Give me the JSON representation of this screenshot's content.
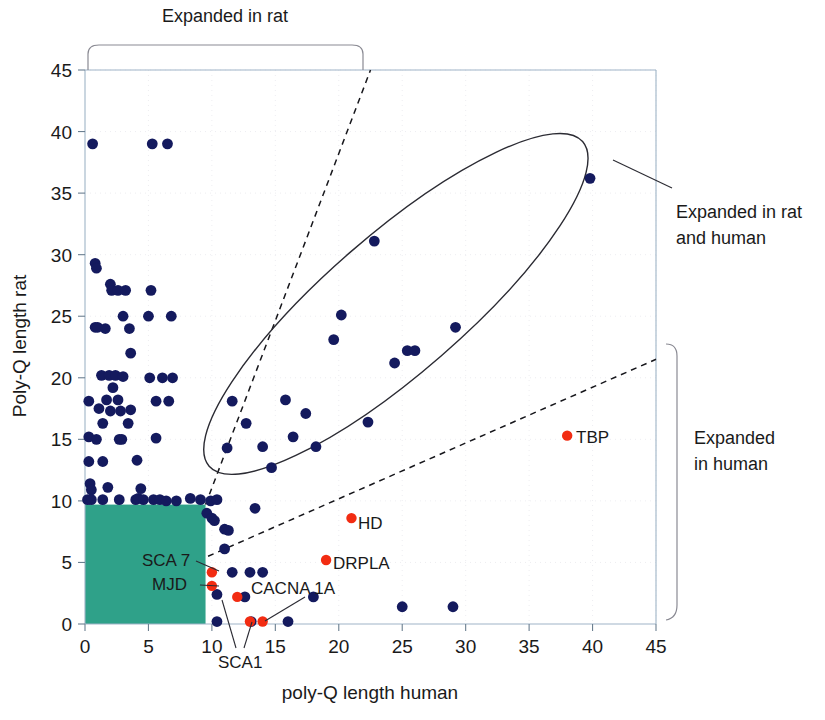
{
  "chart_data": {
    "type": "scatter",
    "title": "",
    "xlabel": "poly-Q length human",
    "ylabel": "Poly-Q length rat",
    "xlim": [
      0,
      45
    ],
    "ylim": [
      0,
      45
    ],
    "xticks": [
      0,
      5,
      10,
      15,
      20,
      25,
      30,
      35,
      40,
      45
    ],
    "yticks": [
      0,
      5,
      10,
      15,
      20,
      25,
      30,
      35,
      40,
      45
    ],
    "grid": true,
    "legend": "none",
    "series": [
      {
        "name": "genes",
        "color": "#141a5e",
        "points": [
          [
            0.6,
            39.0
          ],
          [
            5.3,
            39.0
          ],
          [
            6.5,
            39.0
          ],
          [
            0.8,
            29.3
          ],
          [
            0.9,
            28.9
          ],
          [
            2.0,
            27.6
          ],
          [
            2.1,
            27.1
          ],
          [
            2.6,
            27.1
          ],
          [
            3.2,
            27.1
          ],
          [
            5.2,
            27.1
          ],
          [
            0.8,
            24.1
          ],
          [
            1.0,
            24.1
          ],
          [
            1.6,
            24.0
          ],
          [
            3.0,
            25.0
          ],
          [
            5.0,
            25.0
          ],
          [
            6.8,
            25.0
          ],
          [
            3.5,
            24.0
          ],
          [
            3.6,
            22.0
          ],
          [
            1.3,
            20.2
          ],
          [
            1.9,
            20.2
          ],
          [
            2.4,
            20.2
          ],
          [
            3.0,
            20.1
          ],
          [
            5.1,
            20.0
          ],
          [
            6.1,
            20.0
          ],
          [
            6.9,
            20.0
          ],
          [
            2.2,
            19.2
          ],
          [
            0.3,
            18.1
          ],
          [
            1.7,
            18.2
          ],
          [
            2.6,
            18.2
          ],
          [
            5.6,
            18.1
          ],
          [
            6.6,
            18.1
          ],
          [
            1.1,
            17.5
          ],
          [
            2.0,
            17.3
          ],
          [
            2.8,
            17.3
          ],
          [
            3.6,
            17.4
          ],
          [
            1.4,
            16.3
          ],
          [
            3.4,
            16.3
          ],
          [
            0.3,
            15.2
          ],
          [
            0.9,
            15.0
          ],
          [
            2.7,
            15.0
          ],
          [
            2.9,
            15.0
          ],
          [
            5.6,
            15.1
          ],
          [
            0.3,
            13.2
          ],
          [
            1.4,
            13.2
          ],
          [
            4.1,
            13.3
          ],
          [
            0.4,
            11.4
          ],
          [
            0.5,
            10.9
          ],
          [
            1.8,
            11.1
          ],
          [
            4.4,
            11.0
          ],
          [
            0.2,
            10.1
          ],
          [
            0.5,
            10.1
          ],
          [
            1.4,
            10.1
          ],
          [
            2.7,
            10.1
          ],
          [
            4.0,
            10.1
          ],
          [
            4.2,
            10.2
          ],
          [
            4.6,
            10.1
          ],
          [
            5.4,
            10.1
          ],
          [
            5.9,
            10.1
          ],
          [
            6.4,
            10.0
          ],
          [
            7.2,
            10.0
          ],
          [
            8.3,
            10.2
          ],
          [
            9.1,
            10.1
          ],
          [
            9.9,
            10.0
          ],
          [
            10.4,
            10.1
          ],
          [
            9.6,
            9.0
          ],
          [
            10.0,
            8.6
          ],
          [
            10.2,
            8.4
          ],
          [
            11.0,
            7.7
          ],
          [
            11.3,
            7.6
          ],
          [
            11.0,
            6.1
          ],
          [
            11.6,
            4.2
          ],
          [
            13.0,
            4.2
          ],
          [
            14.0,
            4.2
          ],
          [
            10.4,
            2.4
          ],
          [
            10.4,
            0.2
          ],
          [
            12.6,
            2.2
          ],
          [
            13.1,
            0.2
          ],
          [
            16.0,
            0.2
          ],
          [
            18.0,
            2.2
          ],
          [
            25.0,
            1.4
          ],
          [
            29.0,
            1.4
          ],
          [
            11.2,
            14.3
          ],
          [
            12.7,
            16.3
          ],
          [
            11.6,
            18.1
          ],
          [
            13.4,
            9.4
          ],
          [
            14.0,
            14.4
          ],
          [
            14.7,
            12.7
          ],
          [
            15.8,
            18.2
          ],
          [
            17.4,
            17.1
          ],
          [
            16.4,
            15.2
          ],
          [
            18.2,
            14.4
          ],
          [
            19.6,
            23.1
          ],
          [
            20.2,
            25.1
          ],
          [
            22.8,
            31.1
          ],
          [
            22.3,
            16.4
          ],
          [
            24.4,
            21.2
          ],
          [
            25.4,
            22.2
          ],
          [
            26.0,
            22.2
          ],
          [
            29.2,
            24.1
          ],
          [
            39.8,
            36.2
          ]
        ]
      },
      {
        "name": "disease genes",
        "color": "#f22c12",
        "points": [
          [
            38.0,
            15.3
          ],
          [
            21.0,
            8.6
          ],
          [
            19.0,
            5.2
          ],
          [
            10.0,
            4.2
          ],
          [
            10.0,
            3.1
          ],
          [
            12.0,
            2.2
          ],
          [
            13.0,
            0.2
          ],
          [
            14.0,
            0.2
          ]
        ]
      }
    ],
    "point_labels": [
      {
        "text": "TBP",
        "x": 38.0,
        "y": 15.3
      },
      {
        "text": "HD",
        "x": 21.0,
        "y": 8.6
      },
      {
        "text": "DRPLA",
        "x": 19.0,
        "y": 5.2
      },
      {
        "text": "SCA 7",
        "x": 10.0,
        "y": 4.2
      },
      {
        "text": "MJD",
        "x": 10.0,
        "y": 3.1
      },
      {
        "text": "SCA1",
        "x": 12.0,
        "y": 2.2
      },
      {
        "text": "CACNA 1A",
        "x": 14.0,
        "y": 0.2
      }
    ],
    "annotations": [
      {
        "text": "Expanded in rat",
        "kind": "bracket-top"
      },
      {
        "text": "Expanded in rat",
        "kind": "callout-line1"
      },
      {
        "text": "and human",
        "kind": "callout-line2"
      },
      {
        "text": "Expanded",
        "kind": "bracket-right-line1"
      },
      {
        "text": "in human",
        "kind": "bracket-right-line2"
      }
    ],
    "shapes": {
      "teal_region": {
        "x0": 0,
        "y0": 0,
        "x1": 9.5,
        "y1": 9.7,
        "color": "#2fa189"
      },
      "ellipse": {
        "cx": 24.5,
        "cy": 26.0,
        "rx": 19.5,
        "ry": 5.6,
        "rotate_deg": -41
      },
      "dashed_upper": {
        "x0": 9.5,
        "y0": 9.7,
        "x1": 22.5,
        "y1": 45
      },
      "dashed_lower": {
        "x0": 9.7,
        "y0": 5.5,
        "x1": 45,
        "y1": 21.5
      }
    },
    "colors": {
      "blue": "#141a5e",
      "red": "#f22c12",
      "teal": "#2fa189",
      "axis": "#9fb4c7",
      "grid": "#e8e8ee"
    }
  },
  "labels": {
    "x_axis_title": "poly-Q length human",
    "y_axis_title": "Poly-Q length rat",
    "top_bracket": "Expanded in rat",
    "right_callout_line1": "Expanded in rat",
    "right_callout_line2": "and human",
    "right_bracket_line1": "Expanded",
    "right_bracket_line2": "in human",
    "tbp": "TBP",
    "hd": "HD",
    "drpla": "DRPLA",
    "sca7": "SCA 7",
    "mjd": "MJD",
    "sca1": "SCA1",
    "cacna1a": "CACNA 1A"
  },
  "ticks": {
    "x": [
      "0",
      "5",
      "10",
      "15",
      "20",
      "25",
      "30",
      "35",
      "40",
      "45"
    ],
    "y": [
      "0",
      "5",
      "10",
      "15",
      "20",
      "25",
      "30",
      "35",
      "40",
      "45"
    ]
  }
}
